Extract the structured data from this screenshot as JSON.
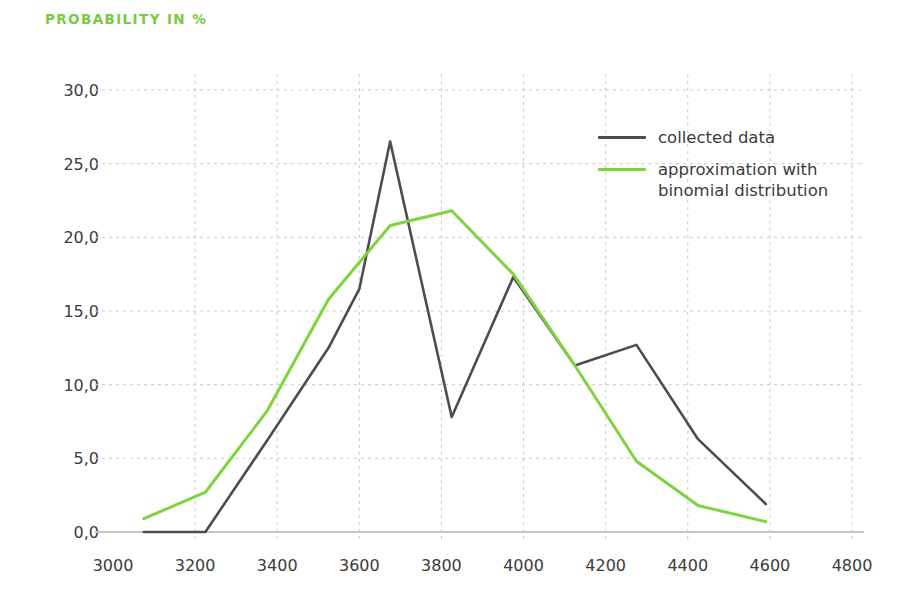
{
  "chart_data": {
    "type": "line",
    "title": "PROBABILITY IN %",
    "xlabel": "",
    "ylabel": "PROBABILITY IN %",
    "xlim": [
      3000,
      4800
    ],
    "ylim": [
      0,
      30
    ],
    "xticks": [
      3000,
      3200,
      3400,
      3600,
      3800,
      4000,
      4200,
      4400,
      4600,
      4800
    ],
    "xtick_labels": [
      "3000",
      "3200",
      "3400",
      "3600",
      "3800",
      "4000",
      "4200",
      "4400",
      "4600",
      "4800"
    ],
    "yticks": [
      0,
      5,
      10,
      15,
      20,
      25,
      30
    ],
    "ytick_labels": [
      "0,0",
      "5,0",
      "10,0",
      "15,0",
      "20,0",
      "25,0",
      "30,0"
    ],
    "grid": true,
    "grid_style": "dashed",
    "grid_color": "#c9c9c9",
    "legend_position": "upper-right-inside",
    "series": [
      {
        "name": "collected data",
        "color": "#4d4d4d",
        "x": [
          3075,
          3225,
          3375,
          3525,
          3600,
          3675,
          3825,
          3975,
          4125,
          4275,
          4425,
          4590
        ],
        "y": [
          0.0,
          0.0,
          6.2,
          12.5,
          16.5,
          26.5,
          7.8,
          17.3,
          11.3,
          12.7,
          6.3,
          1.9
        ]
      },
      {
        "name": "approximation with\nbinomial distribution",
        "color": "#7ed43f",
        "x": [
          3075,
          3225,
          3375,
          3525,
          3675,
          3825,
          3975,
          4125,
          4275,
          4425,
          4590
        ],
        "y": [
          0.9,
          2.7,
          8.2,
          15.8,
          20.8,
          21.8,
          17.5,
          11.3,
          4.8,
          1.8,
          0.7
        ]
      }
    ]
  },
  "legend": {
    "entries": [
      {
        "label": "collected data",
        "color": "#4d4d4d"
      },
      {
        "label": "approximation with\nbinomial distribution",
        "color": "#7ed43f"
      }
    ]
  },
  "axis": {
    "baseline_color": "#c6c6c6"
  }
}
